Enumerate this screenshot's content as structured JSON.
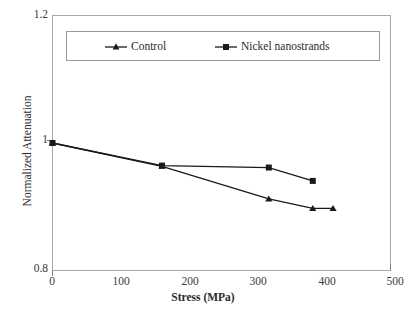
{
  "chart_data": {
    "type": "line",
    "title": "",
    "xlabel": "Stress (MPa)",
    "ylabel": "Normalized Attenuation",
    "xlim": [
      0,
      500
    ],
    "ylim": [
      0.8,
      1.2
    ],
    "xticks": [
      "0",
      "100",
      "200",
      "300",
      "400",
      "500"
    ],
    "yticks": [
      "1.2",
      "1",
      "0.8"
    ],
    "grid": false,
    "legend_position": "top-inside",
    "series": [
      {
        "name": "Control",
        "marker": "triangle",
        "color": "#1a1a1a",
        "x": [
          0,
          162,
          320,
          385,
          415
        ],
        "y": [
          1.0,
          0.9635,
          0.9125,
          0.8975,
          0.8975
        ]
      },
      {
        "name": "Nickel nanostrands",
        "marker": "square",
        "color": "#1a1a1a",
        "x": [
          0,
          162,
          320,
          385
        ],
        "y": [
          1.0,
          0.9645,
          0.9615,
          0.9405
        ]
      }
    ]
  },
  "axes": {
    "y_top_label": "1.2",
    "y_mid_label": "1",
    "y_bottom_label": "0.8",
    "x_labels": [
      "0",
      "100",
      "200",
      "300",
      "400",
      "500"
    ],
    "x_title": "Stress (MPa)",
    "y_title": "Normalized Attenuation"
  },
  "legend": {
    "entries": [
      {
        "label": "Control",
        "marker": "triangle-marker-icon"
      },
      {
        "label": "Nickel nanostrands",
        "marker": "square-marker-icon"
      }
    ]
  },
  "colors": {
    "axis": "#999999",
    "series": "#1a1a1a",
    "text": "#2b2b2b",
    "background": "#ffffff"
  }
}
